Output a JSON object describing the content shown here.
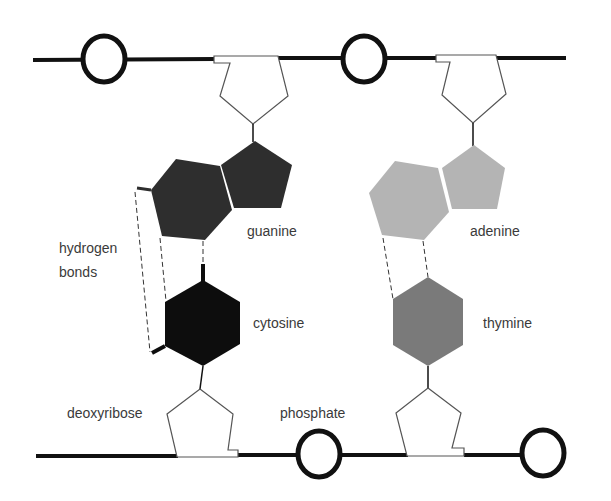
{
  "diagram": {
    "labels": {
      "guanine": "guanine",
      "adenine": "adenine",
      "cytosine": "cytosine",
      "thymine": "thymine",
      "hydrogen_bonds_line1": "hydrogen",
      "hydrogen_bonds_line2": "bonds",
      "deoxyribose": "deoxyribose",
      "phosphate": "phosphate"
    },
    "colors": {
      "guanine": "#2e2e2e",
      "cytosine": "#0d0d0d",
      "adenine": "#b4b4b4",
      "thymine": "#7a7a7a",
      "backbone": "#111111",
      "sugar_outline": "#555555"
    },
    "base_pairs": [
      {
        "purine": "guanine",
        "pyrimidine": "cytosine",
        "hydrogen_bonds": 3
      },
      {
        "purine": "adenine",
        "pyrimidine": "thymine",
        "hydrogen_bonds": 2
      }
    ]
  }
}
